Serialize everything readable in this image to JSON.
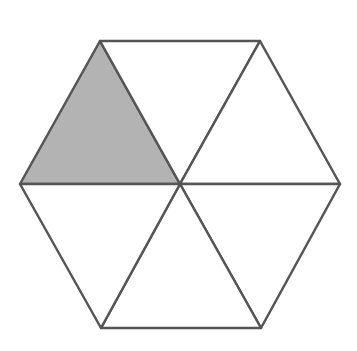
{
  "diagram": {
    "type": "hexagon-divided-into-triangles",
    "colors": {
      "background": "#ffffff",
      "stroke": "#555555",
      "shaded_fill": "#b3b3b3",
      "unshaded_fill": "#ffffff"
    },
    "stroke_width": 2.5,
    "center": [
      180,
      184
    ],
    "vertices": [
      [
        100,
        41
      ],
      [
        260,
        41
      ],
      [
        340,
        184
      ],
      [
        261,
        328
      ],
      [
        101,
        328
      ],
      [
        20,
        184
      ]
    ],
    "triangles": [
      {
        "name": "upper-left",
        "points": [
          [
            20,
            184
          ],
          [
            100,
            41
          ],
          [
            180,
            184
          ]
        ],
        "shaded": true
      },
      {
        "name": "top",
        "points": [
          [
            100,
            41
          ],
          [
            260,
            41
          ],
          [
            180,
            184
          ]
        ],
        "shaded": false
      },
      {
        "name": "upper-right",
        "points": [
          [
            260,
            41
          ],
          [
            340,
            184
          ],
          [
            180,
            184
          ]
        ],
        "shaded": false
      },
      {
        "name": "lower-right",
        "points": [
          [
            340,
            184
          ],
          [
            261,
            328
          ],
          [
            180,
            184
          ]
        ],
        "shaded": false
      },
      {
        "name": "bottom",
        "points": [
          [
            261,
            328
          ],
          [
            101,
            328
          ],
          [
            180,
            184
          ]
        ],
        "shaded": false
      },
      {
        "name": "lower-left",
        "points": [
          [
            101,
            328
          ],
          [
            20,
            184
          ],
          [
            180,
            184
          ]
        ],
        "shaded": false
      }
    ],
    "shaded_count": 1,
    "total_count": 6
  }
}
